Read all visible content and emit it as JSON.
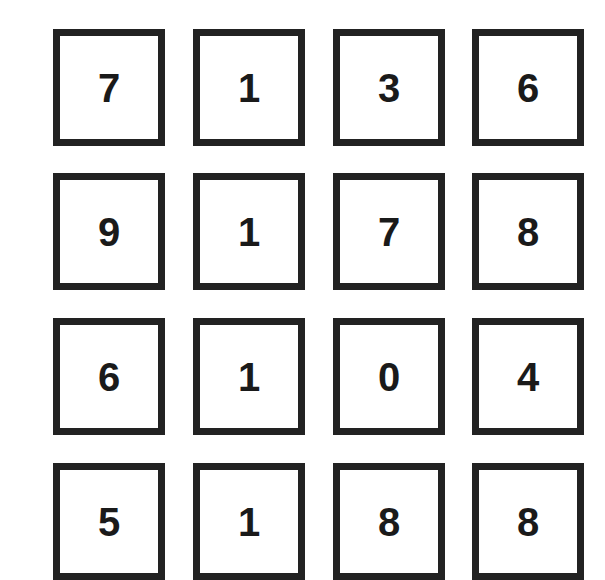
{
  "grid": {
    "columns": 4,
    "rows_visible": 4,
    "border_color": "#222222",
    "digit_color": "#1a1a1a",
    "rows": [
      {
        "cells": [
          "7",
          "1",
          "3",
          "6"
        ]
      },
      {
        "cells": [
          "9",
          "1",
          "7",
          "8"
        ]
      },
      {
        "cells": [
          "6",
          "1",
          "0",
          "4"
        ]
      },
      {
        "cells": [
          "5",
          "1",
          "8",
          "8"
        ],
        "partially_visible": true
      }
    ]
  }
}
